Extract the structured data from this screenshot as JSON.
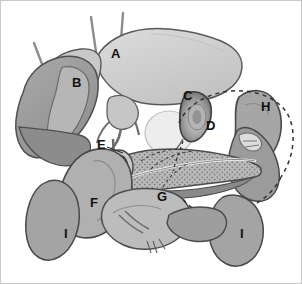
{
  "figure": {
    "background_color": "#ffffff",
    "border_color": "#c9c9c9",
    "style": "grayscale medical illustration"
  },
  "palette": {
    "liver_right_lobe": "#cfcfcf",
    "liver_left_lobe": "#9d9d9d",
    "liver_caudate": "#b8b8b8",
    "gallbladder": "#8f8f8f",
    "gallbladder_highlight": "#c4c4c4",
    "duodenum": "#9a9a9a",
    "stomach": "#a8a8a8",
    "pancreas": "#b5b5b5",
    "pancreas_stipple": "#7e7e7e",
    "kidney": "#a3a3a3",
    "duct": "#efefef",
    "vessel": "#d8d8d8",
    "outline": "#4a4a4a",
    "dashed_outline": "#3a3a3a",
    "label_text": "#111111"
  },
  "labels": [
    {
      "id": "A",
      "text": "A",
      "x": 110,
      "y": 53,
      "organ": "right-lobe-of-liver"
    },
    {
      "id": "B",
      "text": "B",
      "x": 71,
      "y": 82,
      "organ": "left-lobe-of-liver"
    },
    {
      "id": "C",
      "text": "C",
      "x": 185,
      "y": 95,
      "organ": "gallbladder"
    },
    {
      "id": "D",
      "text": "D",
      "x": 206,
      "y": 125,
      "organ": "duodenum-descending-part"
    },
    {
      "id": "E",
      "text": "E",
      "x": 98,
      "y": 144,
      "organ": "common-bile-duct"
    },
    {
      "id": "F",
      "text": "F",
      "x": 91,
      "y": 202,
      "organ": "pancreatic-head"
    },
    {
      "id": "G",
      "text": "G",
      "x": 158,
      "y": 196,
      "organ": "pancreatic-body"
    },
    {
      "id": "H",
      "text": "H",
      "x": 263,
      "y": 106,
      "organ": "stomach"
    },
    {
      "id": "I",
      "text": "I",
      "x": 63,
      "y": 233,
      "organ": "right-kidney"
    },
    {
      "id": "I2",
      "text": "I",
      "x": 240,
      "y": 233,
      "organ": "left-kidney"
    }
  ],
  "features": {
    "vessel_stalk_count": 3,
    "dashed_regions": 2,
    "stippled_region": "pancreas",
    "leader_lines": 3
  }
}
